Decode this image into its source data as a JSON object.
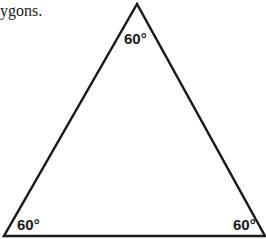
{
  "caption": {
    "text": "ygons."
  },
  "diagram": {
    "shape": "equilateral-triangle",
    "vertices": {
      "top": [
        137,
        4
      ],
      "bottom_left": [
        4,
        236
      ],
      "bottom_right": [
        265,
        236
      ]
    },
    "stroke_color": "#1a1a1a",
    "angles": [
      {
        "vertex": "top",
        "label": "60°"
      },
      {
        "vertex": "bottom_left",
        "label": "60°"
      },
      {
        "vertex": "bottom_right",
        "label": "60°"
      }
    ]
  }
}
